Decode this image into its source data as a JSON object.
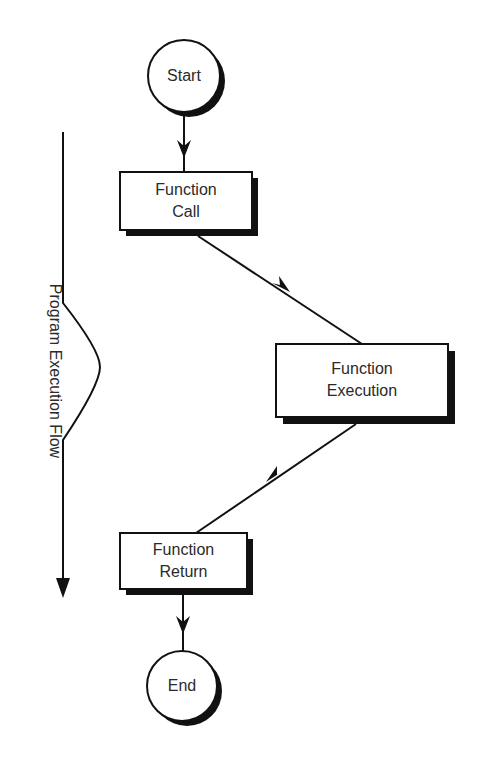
{
  "diagram": {
    "type": "flowchart",
    "nodes": {
      "start": {
        "label": "Start",
        "shape": "circle"
      },
      "call": {
        "line1": "Function",
        "line2": "Call",
        "shape": "box"
      },
      "execution": {
        "line1": "Function",
        "line2": "Execution",
        "shape": "box"
      },
      "return": {
        "line1": "Function",
        "line2": "Return",
        "shape": "box"
      },
      "end": {
        "label": "End",
        "shape": "circle"
      }
    },
    "edges": [
      {
        "from": "start",
        "to": "call"
      },
      {
        "from": "call",
        "to": "execution"
      },
      {
        "from": "execution",
        "to": "return"
      },
      {
        "from": "return",
        "to": "end"
      }
    ],
    "side_axis_label": "Program Execution Flow",
    "colors": {
      "stroke": "#111111",
      "fill": "#ffffff",
      "text": "#2a2a2a"
    }
  }
}
